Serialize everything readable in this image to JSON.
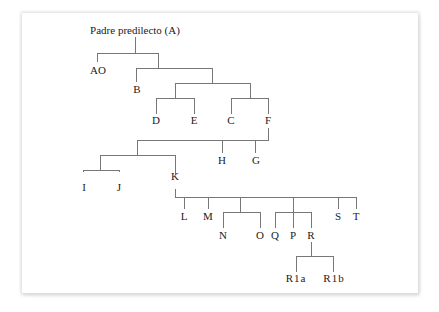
{
  "diagram": {
    "type": "tree",
    "root": "Padre predilecto (A)",
    "nodes": {
      "root": "Padre predilecto (A)",
      "AO": "AO",
      "B": "B",
      "D": "D",
      "E": "E",
      "C": "C",
      "F": "F",
      "H": "H",
      "G": "G",
      "I": "I",
      "J": "J",
      "K": "K",
      "L": "L",
      "M": "M",
      "N": "N",
      "O": "O",
      "Q": "Q",
      "P": "P",
      "R": "R",
      "S": "S",
      "T": "T",
      "R1a": "R1a",
      "R1b": "R1b"
    },
    "edges": [
      [
        "root",
        "AO"
      ],
      [
        "root",
        "B"
      ],
      [
        "B",
        "D"
      ],
      [
        "B",
        "E"
      ],
      [
        "B",
        "C"
      ],
      [
        "B",
        "F"
      ],
      [
        "F",
        "I"
      ],
      [
        "F",
        "J"
      ],
      [
        "F",
        "K"
      ],
      [
        "F",
        "H"
      ],
      [
        "F",
        "G"
      ],
      [
        "K",
        "L"
      ],
      [
        "K",
        "M"
      ],
      [
        "K",
        "N"
      ],
      [
        "K",
        "O"
      ],
      [
        "K",
        "Q"
      ],
      [
        "K",
        "P"
      ],
      [
        "K",
        "R"
      ],
      [
        "K",
        "S"
      ],
      [
        "K",
        "T"
      ],
      [
        "R",
        "R1a"
      ],
      [
        "R",
        "R1b"
      ]
    ]
  }
}
